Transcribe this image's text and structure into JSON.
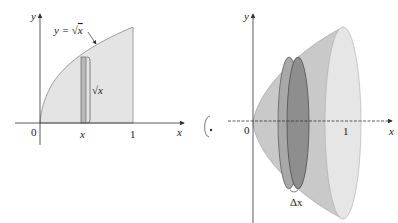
{
  "left_panel": {
    "axis_y_label": "y",
    "axis_x_label": "x",
    "origin_label": "0",
    "tick_one_label": "1",
    "strip_x_label": "x",
    "curve_label_prefix": "y = ",
    "curve_label_radicand": "x",
    "strip_height_radicand": "x"
  },
  "rotation_symbol": "rotation-about-x-axis",
  "right_panel": {
    "axis_y_label": "y",
    "axis_x_label": "x",
    "origin_label": "0",
    "tick_one_label": "1",
    "disk_thickness_label": "Δx"
  },
  "colors": {
    "region_fill": "#e4e4e4",
    "strip_fill": "#b8b8b8",
    "solid_fill": "#c9c9c9",
    "solid_face": "#e6e6e6",
    "disk_fill": "#8e8e8e",
    "axis": "#333333"
  }
}
